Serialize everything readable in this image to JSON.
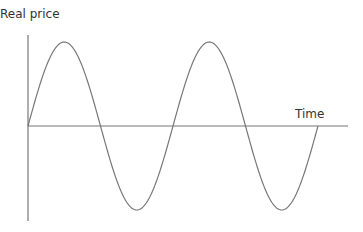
{
  "chart_data": {
    "type": "line",
    "title": "",
    "ylabel": "Real price",
    "xlabel": "Time",
    "grid": false,
    "legend": "none",
    "axis_ticks": false,
    "series": [
      {
        "name": "Real price over time",
        "description": "Cyclical oscillation around a constant level (sketched sine wave, two full cycles)",
        "points": [
          {
            "t": 0.0,
            "value": 0.0
          },
          {
            "t": 0.25,
            "value": 1.0
          },
          {
            "t": 0.5,
            "value": 0.0
          },
          {
            "t": 0.75,
            "value": -1.0
          },
          {
            "t": 1.0,
            "value": 0.0
          },
          {
            "t": 1.25,
            "value": 1.0
          },
          {
            "t": 1.5,
            "value": 0.0
          },
          {
            "t": 1.75,
            "value": -1.0
          },
          {
            "t": 2.0,
            "value": 0.0
          }
        ]
      }
    ],
    "x_range": [
      0,
      2.2
    ],
    "y_range": [
      -1.12,
      1.12
    ],
    "colors": {
      "axis": "#777777",
      "curve": "#777777",
      "text": "#333333"
    }
  }
}
